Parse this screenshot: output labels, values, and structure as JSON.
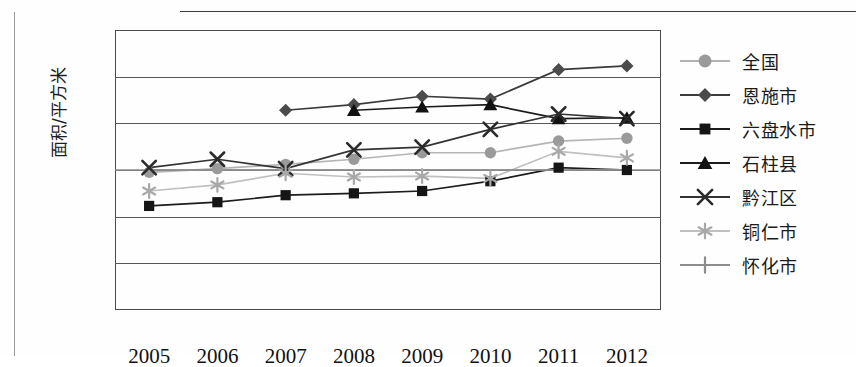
{
  "figure": {
    "ghost_text_top": "",
    "y_axis_title": "面积/平方米"
  },
  "chart_data": {
    "type": "line",
    "title": "",
    "subtitle": "",
    "xlabel": "",
    "ylabel": "面积/平方米",
    "categories": [
      "2005",
      "2006",
      "2007",
      "2008",
      "2009",
      "2010",
      "2011",
      "2012"
    ],
    "x_tick_labels": [
      "2005",
      "2006",
      "2007",
      "2008",
      "2009",
      "2010",
      "2011",
      "2012"
    ],
    "y_tick_labels": [
      "0",
      "10",
      "20",
      "30",
      "40",
      "50",
      "60"
    ],
    "y_ticks": [
      0,
      10,
      20,
      30,
      40,
      50,
      60
    ],
    "ylim": [
      0,
      60
    ],
    "grid": "horizontal",
    "legend_position": "right",
    "series": [
      {
        "name": "全国",
        "marker": "circle",
        "color": "#9a9a9a",
        "line_color": "#b4b4b4",
        "values": [
          29.5,
          30.3,
          31.2,
          32.3,
          33.7,
          33.7,
          36.2,
          36.8
        ]
      },
      {
        "name": "恩施市",
        "marker": "diamond",
        "color": "#4b4b4b",
        "line_color": "#3a3a3a",
        "values": [
          null,
          null,
          42.8,
          44.0,
          45.8,
          45.2,
          51.5,
          52.3
        ]
      },
      {
        "name": "六盘水市",
        "marker": "square",
        "color": "#151515",
        "line_color": "#1c1c1c",
        "values": [
          22.3,
          23.1,
          24.6,
          25.0,
          25.5,
          27.6,
          30.5,
          30.0
        ]
      },
      {
        "name": "石柱县",
        "marker": "triangle",
        "color": "#121212",
        "line_color": "#1c1c1c",
        "values": [
          null,
          null,
          null,
          42.8,
          43.5,
          44.0,
          41.0,
          41.2
        ]
      },
      {
        "name": "黔江区",
        "marker": "x",
        "color": "#2a2a2a",
        "line_color": "#333333",
        "values": [
          30.5,
          32.3,
          30.3,
          34.3,
          34.9,
          38.7,
          42.0,
          41.0
        ]
      },
      {
        "name": "铜仁市",
        "marker": "asterisk",
        "color": "#a8a8a8",
        "line_color": "#c0c0c0",
        "values": [
          25.5,
          26.8,
          29.3,
          28.5,
          28.7,
          28.2,
          34.0,
          32.6
        ]
      },
      {
        "name": "怀化市",
        "marker": "plus",
        "color": "#8d8d8d",
        "line_color": "#8d8d8d",
        "values": [
          30.0,
          30.0,
          30.0,
          30.0,
          30.0,
          30.0,
          30.0,
          30.0
        ]
      }
    ]
  },
  "legend": {
    "items": [
      {
        "label": "全国"
      },
      {
        "label": "恩施市"
      },
      {
        "label": "六盘水市"
      },
      {
        "label": "石柱县"
      },
      {
        "label": "黔江区"
      },
      {
        "label": "铜仁市"
      },
      {
        "label": "怀化市"
      }
    ]
  }
}
